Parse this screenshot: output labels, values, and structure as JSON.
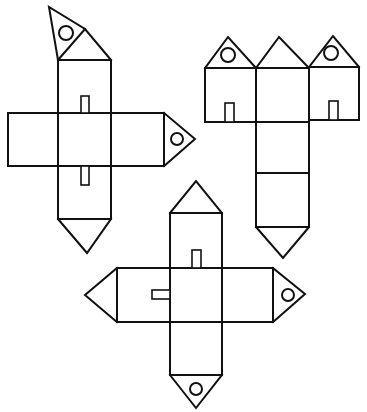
{
  "diagram": {
    "title": "Paper house nets",
    "stroke_color": "#111111",
    "background_color": "#ffffff",
    "nets": [
      {
        "id": "net-1",
        "label": "Cross-shaped house net with tilted roof flap",
        "column": {
          "x": 58,
          "y": 60,
          "w": 53,
          "h": 159
        },
        "band": {
          "x": 8,
          "y": 113,
          "w": 156,
          "h": 53
        },
        "top_flap": {
          "points": "58,60 49,7 85,29 111,60",
          "divider": "58,60 85,29",
          "window": {
            "cx": 66,
            "cy": 33,
            "r": 7
          }
        },
        "right_flap": {
          "points": "164,113 195,139 164,166",
          "window": {
            "cx": 177,
            "cy": 139,
            "r": 6
          }
        },
        "bottom_point": {
          "points": "58,219 87,253 111,219"
        },
        "doors": [
          {
            "x": 81,
            "y": 96,
            "w": 8,
            "h": 17
          },
          {
            "x": 81,
            "y": 166,
            "w": 8,
            "h": 19
          }
        ]
      },
      {
        "id": "net-2",
        "label": "T-shaped three-house row net",
        "houses": [
          {
            "x": 205,
            "y": 68,
            "w": 51,
            "h": 54,
            "roof": "205,68 228,37 256,68",
            "window": {
              "cx": 228,
              "cy": 55,
              "r": 7
            },
            "door": {
              "x": 225,
              "y": 103,
              "w": 9,
              "h": 19
            }
          },
          {
            "x": 256,
            "y": 68,
            "w": 53,
            "h": 54,
            "roof": "256,68 279,37 309,68"
          },
          {
            "x": 309,
            "y": 67,
            "w": 50,
            "h": 53,
            "roof": "309,67 333,36 359,67",
            "window": {
              "cx": 331,
              "cy": 53,
              "r": 7
            },
            "door": {
              "x": 329,
              "y": 101,
              "w": 9,
              "h": 19
            }
          }
        ],
        "column": {
          "x": 256,
          "y": 122,
          "w": 53,
          "h": 105,
          "divider_y": 173
        },
        "bottom_point": {
          "points": "256,227 283,258 309,227"
        }
      },
      {
        "id": "net-3",
        "label": "Cross-shaped house net with side flaps",
        "column": {
          "x": 170,
          "y": 213,
          "w": 52,
          "h": 162
        },
        "roof": {
          "points": "170,213 196,181 222,213"
        },
        "band": {
          "x": 117,
          "y": 268,
          "w": 156,
          "h": 54
        },
        "left_flap": {
          "points": "117,268 85,295 117,322"
        },
        "right_flap": {
          "points": "273,268 305,294 273,322",
          "window": {
            "cx": 288,
            "cy": 295,
            "r": 6
          }
        },
        "bottom_flap": {
          "points": "170,375 196,408 222,375",
          "window": {
            "cx": 196,
            "cy": 389,
            "r": 6
          }
        },
        "doors": [
          {
            "x": 192,
            "y": 250,
            "w": 9,
            "h": 18
          },
          {
            "x": 152,
            "y": 290,
            "w": 18,
            "h": 9
          }
        ]
      }
    ]
  }
}
